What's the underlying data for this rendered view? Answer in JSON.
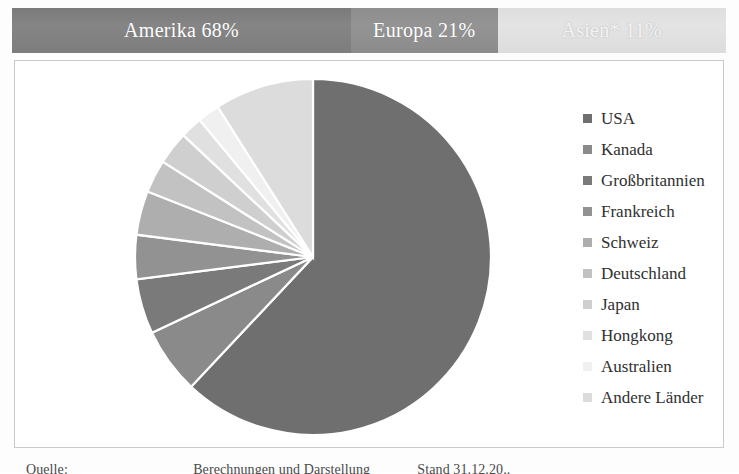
{
  "region_bar": {
    "segments": [
      {
        "label": "Amerika 68%",
        "value": 68,
        "color": "#808080",
        "width_pct": 47.5
      },
      {
        "label": "Europa 21%",
        "value": 21,
        "color": "#909090",
        "width_pct": 20.5
      },
      {
        "label": "Asien* 11%",
        "value": 11,
        "color": "#e0e0e0",
        "width_pct": 32.0
      }
    ]
  },
  "legend": {
    "position": "right",
    "items": [
      {
        "label": "USA",
        "color": "#6f6f6f"
      },
      {
        "label": "Kanada",
        "color": "#8a8a8a"
      },
      {
        "label": "Großbritannien",
        "color": "#7a7a7a"
      },
      {
        "label": "Frankreich",
        "color": "#929292"
      },
      {
        "label": "Schweiz",
        "color": "#aeaeae"
      },
      {
        "label": "Deutschland",
        "color": "#c2c2c2"
      },
      {
        "label": "Japan",
        "color": "#cfcfcf"
      },
      {
        "label": "Hongkong",
        "color": "#e0e0e0"
      },
      {
        "label": "Australien",
        "color": "#f0f0f0"
      },
      {
        "label": "Andere Länder",
        "color": "#dcdcdc"
      }
    ]
  },
  "source": {
    "text_fragments": [
      "Quelle:",
      "Berechnungen und Darstellung",
      "Stand 31.12.20.."
    ],
    "visible": "partially cropped"
  },
  "chart_data": {
    "type": "pie",
    "title": "",
    "subtitle": "",
    "xlabel": "",
    "ylabel": "",
    "grid": false,
    "legend_position": "right",
    "start_angle_deg": 0,
    "direction": "clockwise",
    "categories": [
      "USA",
      "Kanada",
      "Großbritannien",
      "Frankreich",
      "Schweiz",
      "Deutschland",
      "Japan",
      "Hongkong",
      "Australien",
      "Andere Länder"
    ],
    "values": [
      62,
      6,
      5,
      4,
      4,
      3,
      3,
      2,
      2,
      9
    ],
    "unit": "%",
    "slice_colors": [
      "#6f6f6f",
      "#8a8a8a",
      "#7a7a7a",
      "#929292",
      "#aeaeae",
      "#c2c2c2",
      "#cfcfcf",
      "#e0e0e0",
      "#f0f0f0",
      "#dcdcdc"
    ],
    "groups": [
      {
        "name": "Amerika",
        "value": 68
      },
      {
        "name": "Europa",
        "value": 21
      },
      {
        "name": "Asien*",
        "value": 11
      }
    ]
  }
}
